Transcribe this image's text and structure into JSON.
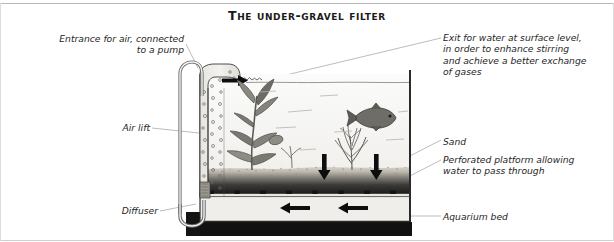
{
  "figure": {
    "title": "The under-gravel filter",
    "title_display": "The under-gravel filter"
  },
  "labels": {
    "entrance": "Entrance for air, connected\nto a pump",
    "air_lift": "Air lift",
    "diffuser": "Diffuser",
    "exit": "Exit for water at surface level,\nin order to enhance stirring\nand achieve a better exchange\nof gases",
    "sand": "Sand",
    "platform": "Perforated platform allowing\nwater to pass through",
    "aquarium_bed": "Aquarium bed"
  },
  "diagram": {
    "flow_arrows": {
      "outflow_label": "water-exits-at-surface",
      "downflow_count": 2,
      "underbed_count": 2,
      "underbed_direction": "left"
    },
    "elements": [
      "air-tube",
      "air-lift-column",
      "diffuser-u-bend",
      "gravel-bed",
      "perforated-platform",
      "aquarium-bed-block",
      "water-surface",
      "broad-leaf-plant",
      "feathery-plant",
      "fish"
    ]
  },
  "colors": {
    "ink": "#1a1a1a",
    "label_text": "#262626",
    "water": "#f2f2f0",
    "gravel_light": "#d8d5cd",
    "gravel_dark": "#1d1d1d",
    "tank_wall": "#2b2b2b",
    "bed_block": "#111111",
    "leader_line": "#a8a8a8",
    "frame": "#c4c4c4"
  }
}
